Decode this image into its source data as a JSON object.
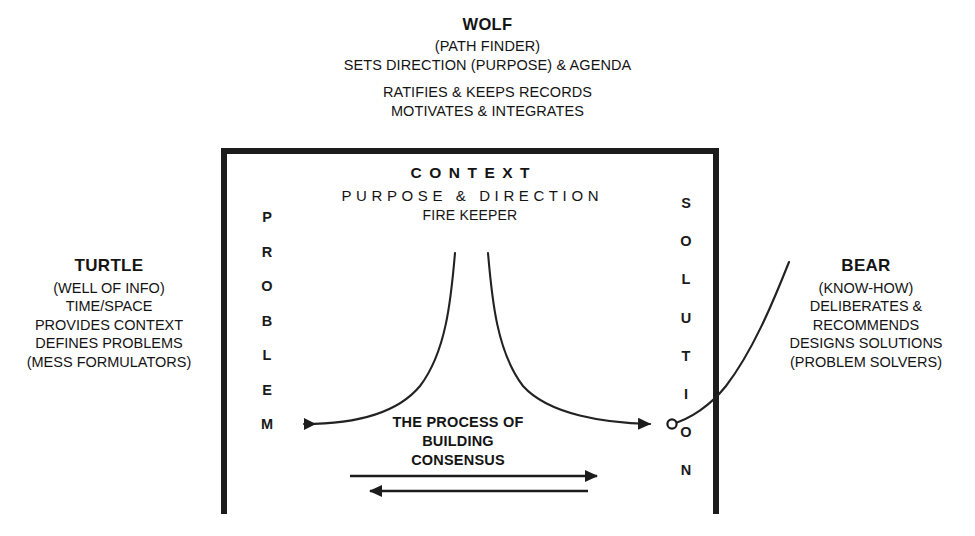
{
  "diagram": {
    "title_roles": [
      "WOLF",
      "TURTLE",
      "BEAR"
    ],
    "wolf": {
      "name": "WOLF",
      "subtitle": "(PATH FINDER)",
      "line1": "SETS DIRECTION (PURPOSE) & AGENDA",
      "line2": "RATIFIES & KEEPS RECORDS",
      "line3": "MOTIVATES & INTEGRATES"
    },
    "turtle": {
      "name": "TURTLE",
      "line1": "(WELL OF INFO)",
      "line2": "TIME/SPACE",
      "line3": "PROVIDES CONTEXT",
      "line4": "DEFINES PROBLEMS",
      "line5": "(MESS FORMULATORS)"
    },
    "bear": {
      "name": "BEAR",
      "line1": "(KNOW-HOW)",
      "line2": "DELIBERATES &",
      "line3": "RECOMMENDS",
      "line4": "DESIGNS SOLUTIONS",
      "line5": "(PROBLEM SOLVERS)"
    },
    "context": {
      "title": "CONTEXT",
      "subtitle": "PURPOSE & DIRECTION",
      "role": "FIRE KEEPER"
    },
    "axis_left": {
      "word": "PROBLEM",
      "letters": [
        "P",
        "R",
        "O",
        "B",
        "L",
        "E",
        "M"
      ]
    },
    "axis_right": {
      "word": "SOLUTION",
      "letters": [
        "S",
        "O",
        "L",
        "U",
        "T",
        "I",
        "O",
        "N"
      ]
    },
    "process": {
      "line1": "THE PROCESS OF",
      "line2": "BUILDING",
      "line3": "CONSENSUS"
    },
    "colors": {
      "ink": "#1c1c1c",
      "background": "#ffffff",
      "stroke": "#222222"
    }
  }
}
